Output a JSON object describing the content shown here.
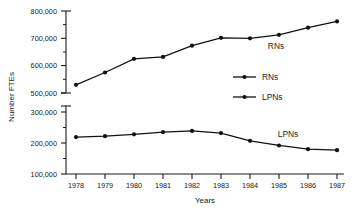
{
  "chart_data": {
    "type": "line",
    "title": "",
    "xlabel": "Years",
    "ylabel": "Number FTEs",
    "grid": false,
    "legend_position": "center-right",
    "broken_axis": true,
    "categories": [
      "1978",
      "1979",
      "1980",
      "1981",
      "1982",
      "1983",
      "1984",
      "1985",
      "1986",
      "1987"
    ],
    "upper_panel": {
      "ylim": [
        500000,
        800000
      ],
      "ticks": [
        500000,
        600000,
        700000,
        800000
      ],
      "tick_labels": [
        "500,000",
        "600,000",
        "700,000",
        "800,000"
      ],
      "minor_tick_step": 50000
    },
    "lower_panel": {
      "ylim": [
        100000,
        300000
      ],
      "ticks": [
        100000,
        200000,
        300000
      ],
      "tick_labels": [
        "100,000",
        "200,000",
        "300,000"
      ],
      "minor_tick_step": 50000
    },
    "series": [
      {
        "name": "RNs",
        "panel": "upper",
        "values": [
          530000,
          575000,
          625000,
          632000,
          673000,
          702000,
          700000,
          713000,
          739000,
          762000
        ]
      },
      {
        "name": "LPNs",
        "panel": "lower",
        "values": [
          219000,
          222000,
          228000,
          235000,
          239000,
          232000,
          207000,
          192000,
          180000,
          177000
        ]
      }
    ],
    "annotations": [
      {
        "text": "RNs",
        "panel": "upper",
        "near_year": "1985"
      },
      {
        "text": "LPNs",
        "panel": "lower",
        "near_year": "1985"
      }
    ],
    "legend_entries": [
      {
        "label": "RNs",
        "marker": "filled-circle"
      },
      {
        "label": "LPNs",
        "marker": "filled-circle"
      }
    ]
  },
  "axis_titles": {
    "x": "Years",
    "y": "Number FTEs"
  },
  "y_tick_labels_upper": [
    "800,000",
    "700,000",
    "600,000",
    "500,000"
  ],
  "y_tick_labels_lower": [
    "300,000",
    "200,000",
    "100,000"
  ],
  "x_tick_labels": [
    "1978",
    "1979",
    "1980",
    "1981",
    "1982",
    "1983",
    "1984",
    "1985",
    "1986",
    "1987"
  ],
  "series_labels": {
    "rns": "RNs",
    "lpns": "LPNs"
  },
  "legend": {
    "rns": "RNs",
    "lpns": "LPNs"
  },
  "colors": {
    "ink": "#111111",
    "background": "#ffffff"
  }
}
